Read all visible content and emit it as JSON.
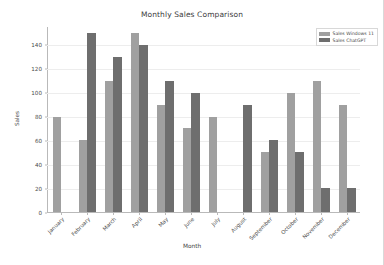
{
  "chart_data": {
    "type": "bar",
    "title": "Monthly Sales Comparison",
    "xlabel": "Month",
    "ylabel": "Sales",
    "categories": [
      "January",
      "February",
      "March",
      "April",
      "May",
      "June",
      "July",
      "August",
      "September",
      "October",
      "November",
      "December"
    ],
    "series": [
      {
        "name": "Sales Windows 11",
        "color": "#a0a0a0",
        "values": [
          80,
          60,
          110,
          150,
          90,
          70,
          80,
          0,
          50,
          100,
          110,
          90
        ]
      },
      {
        "name": "Sales ChatGPT",
        "color": "#6e6e6e",
        "values": [
          0,
          150,
          130,
          140,
          110,
          100,
          0,
          90,
          60,
          50,
          20,
          20
        ]
      }
    ],
    "ylim": [
      0,
      155
    ],
    "yticks": [
      0,
      20,
      40,
      60,
      80,
      100,
      120,
      140
    ],
    "grid": true,
    "legend_position": "top-right"
  },
  "legend": {
    "entries": [
      {
        "label": "Sales Windows 11"
      },
      {
        "label": "Sales ChatGPT"
      }
    ]
  }
}
